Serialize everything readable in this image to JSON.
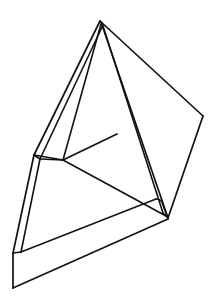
{
  "document": {
    "title": "Line Drawing",
    "background_color": "#ffffff",
    "width": 217,
    "height": 305
  },
  "figure": {
    "name": "wireframe-polyhedron-sketch",
    "stroke_color": "#121212",
    "fill_color": "#ffffff",
    "stroke_width": 1.6,
    "vertices": {
      "apex": [
        100,
        21
      ],
      "apex_inner": [
        103,
        25
      ],
      "right_panel_corner": [
        203,
        116
      ],
      "right_foot": [
        168,
        218
      ],
      "right_foot_inner": [
        163,
        214
      ],
      "base_top_right": [
        156,
        199
      ],
      "base_top_right_round": [
        161,
        202
      ],
      "mid_left_outer": [
        34,
        155
      ],
      "mid_left_inner": [
        40,
        159
      ],
      "inner_node": [
        63,
        160
      ],
      "crossbar_right": [
        117,
        134
      ],
      "left_foot_outer": [
        13,
        253
      ],
      "left_foot_inner": [
        21,
        252
      ],
      "bottom_left_corner": [
        13,
        288
      ],
      "base_bottom_right": [
        168,
        219
      ]
    },
    "edges": [
      {
        "name": "apex-to-left-leg-outer",
        "from": [
          100,
          21
        ],
        "to": [
          34,
          155
        ]
      },
      {
        "name": "apex-to-left-leg-inner",
        "from": [
          103,
          25
        ],
        "to": [
          40,
          159
        ]
      },
      {
        "name": "apex-to-right-panel",
        "from": [
          100,
          21
        ],
        "to": [
          203,
          116
        ]
      },
      {
        "name": "right-panel-to-right-foot",
        "from": [
          203,
          116
        ],
        "to": [
          168,
          218
        ]
      },
      {
        "name": "apex-to-right-leg-outer",
        "from": [
          101,
          22
        ],
        "to": [
          168,
          218
        ]
      },
      {
        "name": "apex-to-right-leg-inner",
        "from": [
          103,
          26
        ],
        "to": [
          163,
          213
        ]
      },
      {
        "name": "inner-node-up-to-apex",
        "from": [
          63,
          160
        ],
        "to": [
          101,
          24
        ]
      },
      {
        "name": "crossbar",
        "from": [
          63,
          160
        ],
        "to": [
          117,
          134
        ]
      },
      {
        "name": "inner-node-to-right-foot",
        "from": [
          63,
          160
        ],
        "to": [
          166,
          216
        ]
      },
      {
        "name": "mid-left-outer-to-left-foot",
        "from": [
          34,
          155
        ],
        "to": [
          13,
          253
        ]
      },
      {
        "name": "mid-left-inner-to-left-foot-inner",
        "from": [
          40,
          159
        ],
        "to": [
          21,
          252
        ]
      },
      {
        "name": "mid-left-to-inner-node",
        "from": [
          34,
          155
        ],
        "to": [
          63,
          160
        ]
      },
      {
        "name": "base-top-edge",
        "from": [
          21,
          252
        ],
        "to": [
          156,
          199
        ]
      },
      {
        "name": "base-front-edge",
        "from": [
          13,
          288
        ],
        "to": [
          168,
          219
        ]
      },
      {
        "name": "base-left-end",
        "from": [
          13,
          253
        ],
        "to": [
          13,
          288
        ]
      },
      {
        "name": "base-right-end",
        "from": [
          161,
          202
        ],
        "to": [
          168,
          219
        ]
      },
      {
        "name": "base-top-right-round",
        "from": [
          156,
          199
        ],
        "to": [
          163,
          204
        ]
      }
    ]
  }
}
